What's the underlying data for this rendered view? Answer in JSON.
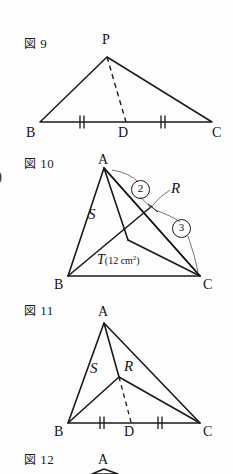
{
  "page": {
    "background_color": "#fdfdfd",
    "ink_color": "#1a1a1a",
    "partial_left_glyph": ")"
  },
  "figures": [
    {
      "id": "fig9",
      "label_kanji": "図",
      "label_number": "9",
      "vertices": [
        {
          "name": "P",
          "label": "P"
        },
        {
          "name": "B",
          "label": "B"
        },
        {
          "name": "D",
          "label": "D"
        },
        {
          "name": "C",
          "label": "C"
        }
      ],
      "dashed_segment": "PD",
      "tick_marks": {
        "count": 2,
        "segments": [
          "BD",
          "DC"
        ]
      }
    },
    {
      "id": "fig10",
      "label_kanji": "図",
      "label_number": "10",
      "vertices": [
        {
          "name": "A",
          "label": "A"
        },
        {
          "name": "B",
          "label": "B"
        },
        {
          "name": "C",
          "label": "C"
        }
      ],
      "regions": [
        {
          "name": "S",
          "label": "S"
        },
        {
          "name": "R",
          "label": "R"
        },
        {
          "name": "T",
          "label": "T"
        }
      ],
      "area_value": "(12 cm",
      "area_exponent": "2",
      "area_close": ")",
      "ratio_labels": [
        {
          "name": "ratio-2",
          "label": "②",
          "value": "2"
        },
        {
          "name": "ratio-3",
          "label": "③",
          "value": "3"
        }
      ]
    },
    {
      "id": "fig11",
      "label_kanji": "図",
      "label_number": "11",
      "vertices": [
        {
          "name": "A",
          "label": "A"
        },
        {
          "name": "B",
          "label": "B"
        },
        {
          "name": "D",
          "label": "D"
        },
        {
          "name": "C",
          "label": "C"
        }
      ],
      "regions": [
        {
          "name": "S",
          "label": "S"
        },
        {
          "name": "R",
          "label": "R"
        }
      ],
      "dashed_segment": "RD",
      "tick_marks": {
        "count": 2,
        "segments": [
          "BD",
          "DC"
        ]
      }
    },
    {
      "id": "fig12",
      "label_kanji": "図",
      "label_number": "12",
      "vertices": [
        {
          "name": "A",
          "label": "A"
        }
      ]
    }
  ]
}
